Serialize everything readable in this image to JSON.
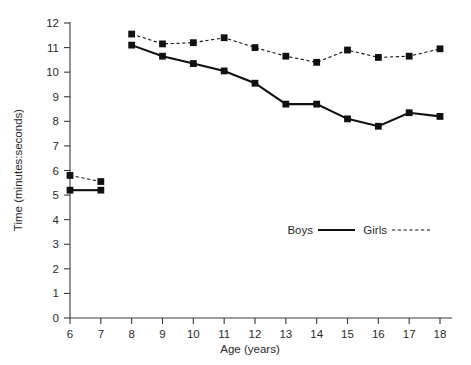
{
  "chart_data": {
    "type": "line",
    "title": "",
    "xlabel": "Age (years)",
    "ylabel": "Time (minutes:seconds)",
    "xlim": [
      6,
      18
    ],
    "ylim": [
      0,
      12
    ],
    "grid": false,
    "legend_position": "inside-right",
    "x": [
      6,
      7,
      8,
      9,
      10,
      11,
      12,
      13,
      14,
      15,
      16,
      17,
      18
    ],
    "xticks": [
      "6",
      "7",
      "8",
      "9",
      "10",
      "11",
      "12",
      "13",
      "14",
      "15",
      "16",
      "17",
      "18"
    ],
    "yticks": [
      "0",
      "1",
      "2",
      "3",
      "4",
      "5",
      "6",
      "7",
      "8",
      "9",
      "10",
      "11",
      "12"
    ],
    "series": [
      {
        "name": "Boys",
        "style": "solid",
        "marker": "square",
        "color": "#111111",
        "segments": [
          {
            "x": [
              6,
              7
            ],
            "values": [
              5.2,
              5.2
            ]
          },
          {
            "x": [
              8,
              9,
              10,
              11,
              12,
              13,
              14,
              15,
              16,
              17,
              18
            ],
            "values": [
              11.1,
              10.65,
              10.35,
              10.05,
              9.55,
              8.7,
              8.7,
              8.1,
              7.8,
              8.35,
              8.2
            ]
          }
        ]
      },
      {
        "name": "Girls",
        "style": "dotted",
        "marker": "square",
        "color": "#111111",
        "segments": [
          {
            "x": [
              6,
              7
            ],
            "values": [
              5.8,
              5.55
            ]
          },
          {
            "x": [
              8,
              9,
              10,
              11,
              12,
              13,
              14,
              15,
              16,
              17,
              18
            ],
            "values": [
              11.55,
              11.15,
              11.2,
              11.4,
              11.0,
              10.65,
              10.4,
              10.9,
              10.6,
              10.65,
              10.95
            ]
          }
        ]
      }
    ]
  },
  "legend": {
    "boys_label": "Boys",
    "girls_label": "Girls"
  },
  "axes": {
    "x_title": "Age (years)",
    "y_title": "Time (minutes:seconds)"
  }
}
